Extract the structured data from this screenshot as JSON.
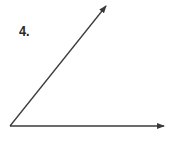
{
  "problem": {
    "number_label": "4."
  },
  "figure": {
    "type": "angle",
    "vertex": [
      10,
      126
    ],
    "ray_horizontal_end": [
      164,
      126
    ],
    "ray_diagonal_end": [
      106,
      6
    ],
    "stroke_color": "#3a3a3a"
  }
}
